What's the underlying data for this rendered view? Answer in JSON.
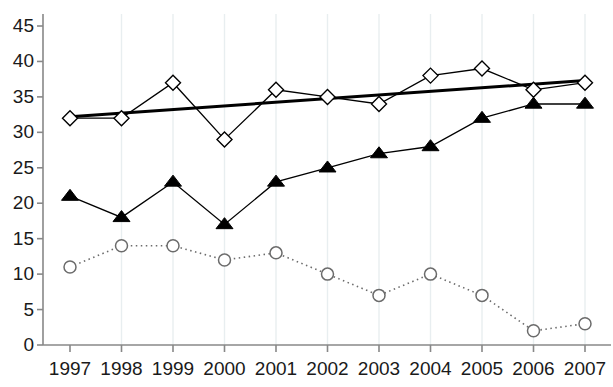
{
  "chart_data": {
    "type": "line",
    "title": "",
    "xlabel": "",
    "ylabel": "",
    "categories": [
      "1997",
      "1998",
      "1999",
      "2000",
      "2001",
      "2002",
      "2003",
      "2004",
      "2005",
      "2006",
      "2007"
    ],
    "ylim": [
      0,
      45
    ],
    "ytick_labels": [
      "0",
      "5",
      "10",
      "15",
      "20",
      "25",
      "30",
      "35",
      "40",
      "45"
    ],
    "ytick_values": [
      0,
      5,
      10,
      15,
      20,
      25,
      30,
      35,
      40,
      45
    ],
    "grid": "vertical-only",
    "legend": "none",
    "series": [
      {
        "name": "diamond-series",
        "marker": "open-diamond",
        "line_style": "solid",
        "color": "#000000",
        "values": [
          32,
          32,
          37,
          29,
          36,
          35,
          34,
          38,
          39,
          36,
          37
        ]
      },
      {
        "name": "triangle-series",
        "marker": "filled-triangle",
        "line_style": "solid",
        "color": "#000000",
        "values": [
          21,
          18,
          23,
          17,
          23,
          25,
          27,
          28,
          32,
          34,
          34
        ]
      },
      {
        "name": "circle-series",
        "marker": "open-circle",
        "line_style": "dotted",
        "color": "#6b6b6b",
        "values": [
          11,
          14,
          14,
          12,
          13,
          10,
          7,
          10,
          7,
          2,
          3
        ]
      }
    ],
    "trendline": {
      "name": "diamond-series-trendline",
      "line_style": "solid-thick",
      "color": "#000000",
      "start": {
        "x": "1997",
        "y": 32.2
      },
      "end": {
        "x": "2007",
        "y": 37.3
      }
    },
    "colors": {
      "axis": "#888888",
      "gridline": "#e8eef0",
      "text": "#1a1a1a"
    }
  }
}
